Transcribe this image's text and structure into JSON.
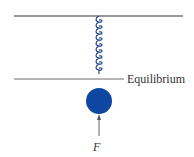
{
  "diagram": {
    "type": "spring-mass",
    "labels": {
      "equilibrium": "Equilibrium",
      "force": "F"
    },
    "colors": {
      "line": "#333333",
      "spring": "#1a3f8f",
      "mass": "#0d47a1",
      "arrow": "#555555"
    }
  }
}
